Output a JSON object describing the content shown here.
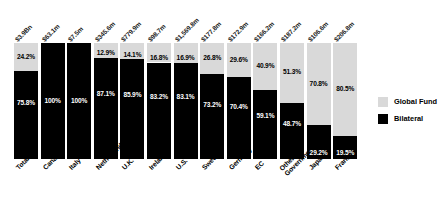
{
  "chart_data": {
    "type": "bar",
    "subtype": "stacked-100-percent",
    "title": "",
    "subtitle": "",
    "xlabel": "",
    "ylabel": "",
    "ylim": [
      0,
      100
    ],
    "grid": false,
    "legend_position": "right",
    "categories": [
      "Total",
      "Canada",
      "Italy",
      "Netherlands",
      "U.K.",
      "Ireland",
      "U.S.",
      "Sweden",
      "Germany",
      "EC",
      "Other Governments",
      "Japan",
      "France"
    ],
    "top_value_labels": [
      "$3.9Bn",
      "$63.1m",
      "$7.5m",
      "$345.6m",
      "$779.9m",
      "$98.7m",
      "$1,569.8m",
      "$177.8m",
      "$172.9m",
      "$166.2m",
      "$187.2m",
      "$106.6m",
      "$206.8m"
    ],
    "series": [
      {
        "name": "Global Fund",
        "color": "#d9d9d9",
        "values": [
          24.2,
          0,
          0,
          12.9,
          14.1,
          16.8,
          16.9,
          26.8,
          29.6,
          40.9,
          51.3,
          70.8,
          80.5
        ],
        "labels": [
          "24.2%",
          "",
          "",
          "12.9%",
          "14.1%",
          "16.8%",
          "16.9%",
          "26.8%",
          "29.6%",
          "40.9%",
          "51.3%",
          "70.8%",
          "80.5%"
        ]
      },
      {
        "name": "Bilateral",
        "color": "#000000",
        "values": [
          75.8,
          100,
          100,
          87.1,
          85.9,
          83.2,
          83.1,
          73.2,
          70.4,
          59.1,
          48.7,
          29.2,
          19.5
        ],
        "labels": [
          "75.8%",
          "100%",
          "100%",
          "87.1%",
          "85.9%",
          "83.2%",
          "83.1%",
          "73.2%",
          "70.4%",
          "59.1%",
          "48.7%",
          "29.2%",
          "19.5%"
        ]
      }
    ],
    "category_label_lines": [
      [
        "Total",
        ""
      ],
      [
        "Canada",
        ""
      ],
      [
        "Italy",
        ""
      ],
      [
        "Netherlands",
        ""
      ],
      [
        "U.K.",
        ""
      ],
      [
        "Ireland",
        ""
      ],
      [
        "U.S.",
        ""
      ],
      [
        "Sweden",
        ""
      ],
      [
        "Germany",
        ""
      ],
      [
        "EC",
        ""
      ],
      [
        "Other",
        "Governments"
      ],
      [
        "Japan",
        ""
      ],
      [
        "France",
        ""
      ]
    ]
  },
  "legend": {
    "items": [
      {
        "label": "Global Fund",
        "color": "#d9d9d9"
      },
      {
        "label": "Bilateral",
        "color": "#000000"
      }
    ]
  }
}
